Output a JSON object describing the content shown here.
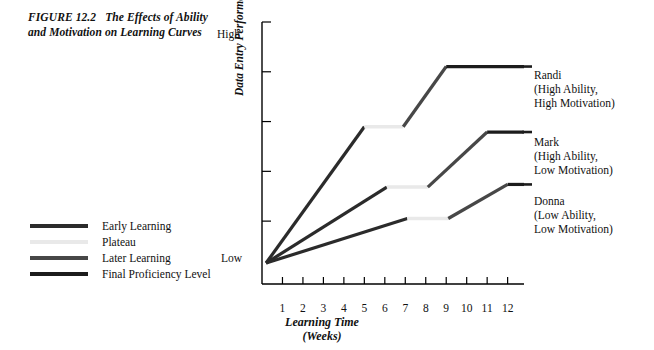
{
  "figure": {
    "number": "FIGURE 12.2",
    "title_line1": "The Effects of",
    "title_line2": "Ability and Motivation on",
    "title_line3": "Learning Curves"
  },
  "legend": {
    "position": "left-lower",
    "items": [
      {
        "label": "Early Learning",
        "color": "#2b2b2b",
        "name": "early-learning"
      },
      {
        "label": "Plateau",
        "color": "#e9e9e9",
        "name": "plateau"
      },
      {
        "label": "Later Learning",
        "color": "#474747",
        "name": "later-learning"
      },
      {
        "label": "Final Proficiency Level",
        "color": "#1c1c1c",
        "name": "final-proficiency-level"
      }
    ]
  },
  "axes": {
    "y_label": "Data Entry Performance Level",
    "y_high": "High",
    "y_low": "Low",
    "x_label_line1": "Learning Time",
    "x_label_line2": "(Weeks)",
    "x_ticks": [
      "1",
      "2",
      "3",
      "4",
      "5",
      "6",
      "7",
      "8",
      "9",
      "10",
      "11",
      "12"
    ]
  },
  "annotations": {
    "randi": {
      "name": "Randi",
      "line2": "(High Ability,",
      "line3": "High Motivation)"
    },
    "mark": {
      "name": "Mark",
      "line2": "(High Ability,",
      "line3": "Low Motivation)"
    },
    "donna": {
      "name": "Donna",
      "line2": "(Low Ability,",
      "line3": "Low Motivation)"
    }
  },
  "colors": {
    "early_learning": "#2b2b2b",
    "plateau": "#e9e9e9",
    "later_learning": "#474747",
    "final_proficiency": "#1c1c1c",
    "axis": "#000000",
    "background": "#ffffff"
  },
  "chart_data": {
    "type": "line",
    "title": "The Effects of Ability and Motivation on Learning Curves",
    "xlabel": "Learning Time (Weeks)",
    "ylabel": "Data Entry Performance Level",
    "xlim": [
      0,
      12.8
    ],
    "ylim": [
      0,
      100
    ],
    "ytick_labels": [
      "Low",
      "High"
    ],
    "ytick_values": [
      8,
      100
    ],
    "grid": false,
    "legend_position": "left-lower",
    "series": [
      {
        "name": "Randi",
        "description": "High Ability, High Motivation",
        "segments": [
          {
            "phase": "Early Learning",
            "x": [
              0.2,
              5.0
            ],
            "y": [
              8,
              60
            ]
          },
          {
            "phase": "Plateau",
            "x": [
              5.0,
              6.9
            ],
            "y": [
              60,
              60
            ]
          },
          {
            "phase": "Later Learning",
            "x": [
              6.9,
              9.0
            ],
            "y": [
              60,
              83
            ]
          },
          {
            "phase": "Final Proficiency Level",
            "x": [
              9.0,
              12.8
            ],
            "y": [
              83,
              83
            ]
          }
        ]
      },
      {
        "name": "Mark",
        "description": "High Ability, Low Motivation",
        "segments": [
          {
            "phase": "Early Learning",
            "x": [
              0.2,
              6.1
            ],
            "y": [
              8,
              37
            ]
          },
          {
            "phase": "Plateau",
            "x": [
              6.1,
              8.1
            ],
            "y": [
              37,
              37
            ]
          },
          {
            "phase": "Later Learning",
            "x": [
              8.1,
              11.0
            ],
            "y": [
              37,
              58
            ]
          },
          {
            "phase": "Final Proficiency Level",
            "x": [
              11.0,
              12.8
            ],
            "y": [
              58,
              58
            ]
          }
        ]
      },
      {
        "name": "Donna",
        "description": "Low Ability, Low Motivation",
        "segments": [
          {
            "phase": "Early Learning",
            "x": [
              0.2,
              7.1
            ],
            "y": [
              8,
              25
            ]
          },
          {
            "phase": "Plateau",
            "x": [
              7.1,
              9.1
            ],
            "y": [
              25,
              25
            ]
          },
          {
            "phase": "Later Learning",
            "x": [
              9.1,
              12.0
            ],
            "y": [
              25,
              38
            ]
          },
          {
            "phase": "Final Proficiency Level",
            "x": [
              12.0,
              12.8
            ],
            "y": [
              38,
              38
            ]
          }
        ]
      }
    ]
  }
}
